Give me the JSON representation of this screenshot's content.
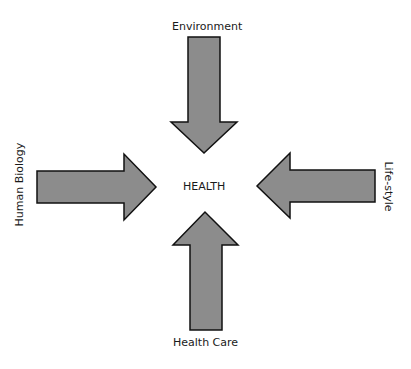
{
  "diagram": {
    "center_label": "HEALTH",
    "arrow_fill": "#8c8c8c",
    "arrow_stroke": "#111111",
    "factors": [
      {
        "position": "top",
        "label": "Environment",
        "direction": "down"
      },
      {
        "position": "left",
        "label": "Human Biology",
        "direction": "right"
      },
      {
        "position": "right",
        "label": "Life-style",
        "direction": "left"
      },
      {
        "position": "bottom",
        "label": "Health Care",
        "direction": "up"
      }
    ]
  }
}
